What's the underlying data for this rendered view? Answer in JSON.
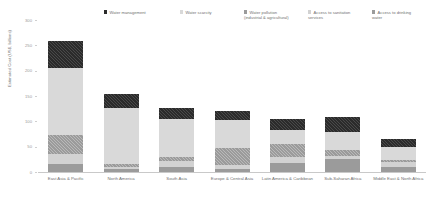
{
  "chart_data": {
    "type": "bar",
    "subtype": "stacked-vertical",
    "title": "",
    "xlabel": "",
    "ylabel": "Estimated Cost (US$, billions)",
    "ylim": [
      0,
      300
    ],
    "yticks": [
      0,
      50,
      100,
      150,
      200,
      250,
      300
    ],
    "ytick_labels": [
      "0",
      "50",
      "100",
      "150",
      "200",
      "250",
      "300"
    ],
    "grid": false,
    "legend_position": "top",
    "categories": [
      "East Asia & Pacific",
      "North America",
      "South Asia",
      "Europe & Central Asia",
      "Latin America & Caribbean",
      "Sub-Saharan Africa",
      "Middle East & North Africa"
    ],
    "series": [
      {
        "name": "Water management",
        "color": "#2b2b2b",
        "pattern": "hatch",
        "values": [
          53,
          28,
          23,
          18,
          22,
          30,
          17
        ]
      },
      {
        "name": "Water scarcity",
        "color": "#d9d9d9",
        "pattern": "solid",
        "values": [
          132,
          111,
          75,
          55,
          28,
          36,
          25
        ]
      },
      {
        "name": "Water pollution (industrial & agricultural)",
        "color": "#9b9b9b",
        "pattern": "hatch",
        "values": [
          39,
          5,
          7,
          34,
          26,
          12,
          5
        ]
      },
      {
        "name": "Access to sanitation services",
        "color": "#d2d2d2",
        "pattern": "solid",
        "values": [
          19,
          4,
          13,
          7,
          12,
          6,
          9
        ]
      },
      {
        "name": "Access to drinking water",
        "color": "#9b9b9b",
        "pattern": "solid",
        "values": [
          16,
          6,
          9,
          6,
          17,
          25,
          10
        ]
      }
    ],
    "totals": [
      259,
      154,
      127,
      120,
      105,
      109,
      66
    ],
    "colors": {
      "water_management": "#2b2b2b",
      "water_scarcity": "#d9d9d9",
      "water_pollution": "#9b9b9b",
      "sanitation": "#d2d2d2",
      "drinking_water": "#9b9b9b",
      "axis": "#c9c9c9",
      "text": "#6f6f6f",
      "background": "#ffffff"
    }
  }
}
